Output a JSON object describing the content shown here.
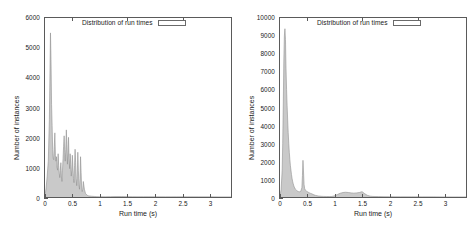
{
  "figure": {
    "panel_count": 2,
    "background": "#ffffff",
    "fill_color": "#c8c8c8",
    "line_color": "#8a8a8a",
    "axis_color": "#5a5a5a"
  },
  "panels": [
    {
      "name": "left-histogram",
      "legend_label": "Distribution of run times",
      "xlabel": "Run time (s)",
      "ylabel": "Number of instances",
      "xticks": [
        "0",
        "0.5",
        "1",
        "1.5",
        "2",
        "2.5",
        "3"
      ],
      "yticks": [
        "0",
        "1000",
        "2000",
        "3000",
        "4000",
        "5000",
        "6000"
      ]
    },
    {
      "name": "right-histogram",
      "legend_label": "Distribution of run times",
      "xlabel": "Run time (s)",
      "ylabel": "Number of instances",
      "xticks": [
        "0",
        "0.5",
        "1",
        "1.5",
        "2",
        "2.5",
        "3"
      ],
      "yticks": [
        "0",
        "1000",
        "2000",
        "3000",
        "4000",
        "5000",
        "6000",
        "7000",
        "8000",
        "9000",
        "10000"
      ]
    }
  ],
  "chart_data": [
    {
      "type": "area",
      "title": "Distribution of run times",
      "legend": [
        "Distribution of run times"
      ],
      "legend_position": "top-center-inside",
      "xlabel": "Run time (s)",
      "ylabel": "Number of instances",
      "xlim": [
        0,
        3.4
      ],
      "ylim": [
        0,
        6000
      ],
      "xticks": [
        0,
        0.5,
        1,
        1.5,
        2,
        2.5,
        3
      ],
      "yticks": [
        0,
        1000,
        2000,
        3000,
        4000,
        5000,
        6000
      ],
      "grid": false,
      "x": [
        0.0,
        0.02,
        0.04,
        0.06,
        0.08,
        0.1,
        0.11,
        0.12,
        0.13,
        0.14,
        0.15,
        0.16,
        0.17,
        0.18,
        0.19,
        0.2,
        0.21,
        0.22,
        0.23,
        0.24,
        0.25,
        0.26,
        0.27,
        0.28,
        0.29,
        0.3,
        0.31,
        0.32,
        0.33,
        0.34,
        0.35,
        0.36,
        0.37,
        0.38,
        0.39,
        0.4,
        0.41,
        0.42,
        0.43,
        0.44,
        0.45,
        0.46,
        0.47,
        0.48,
        0.49,
        0.5,
        0.51,
        0.52,
        0.53,
        0.54,
        0.55,
        0.56,
        0.57,
        0.58,
        0.59,
        0.6,
        0.61,
        0.62,
        0.63,
        0.64,
        0.65,
        0.66,
        0.67,
        0.68,
        0.69,
        0.7,
        0.72,
        0.74,
        0.76,
        0.78,
        0.8,
        0.85,
        0.9,
        0.95,
        1.0,
        1.1,
        1.2,
        1.3,
        1.4,
        1.5,
        1.6,
        1.7,
        1.8,
        1.9,
        2.0,
        2.1,
        2.2,
        2.3,
        2.4,
        2.6,
        2.8,
        3.0,
        3.2,
        3.4
      ],
      "values": [
        40,
        300,
        700,
        1200,
        2600,
        5500,
        4600,
        3100,
        2400,
        1600,
        1300,
        1250,
        1700,
        2150,
        1400,
        1200,
        1350,
        1000,
        900,
        1450,
        1050,
        800,
        650,
        900,
        1150,
        700,
        520,
        900,
        1300,
        1700,
        2050,
        1500,
        1200,
        1600,
        2250,
        1750,
        1100,
        1500,
        2000,
        1300,
        950,
        1450,
        1100,
        700,
        900,
        1400,
        1000,
        620,
        480,
        1050,
        1600,
        1150,
        620,
        380,
        700,
        1500,
        900,
        420,
        260,
        620,
        1350,
        820,
        300,
        180,
        260,
        520,
        260,
        120,
        80,
        50,
        35,
        25,
        18,
        12,
        10,
        8,
        12,
        15,
        14,
        12,
        10,
        8,
        9,
        10,
        8,
        7,
        6,
        6,
        7,
        6,
        5,
        5,
        4,
        4
      ]
    },
    {
      "type": "area",
      "title": "Distribution of run times",
      "legend": [
        "Distribution of run times"
      ],
      "legend_position": "top-center-inside",
      "xlabel": "Run time (s)",
      "ylabel": "Number of instances",
      "xlim": [
        0,
        3.4
      ],
      "ylim": [
        0,
        10000
      ],
      "xticks": [
        0,
        0.5,
        1,
        1.5,
        2,
        2.5,
        3
      ],
      "yticks": [
        0,
        1000,
        2000,
        3000,
        4000,
        5000,
        6000,
        7000,
        8000,
        9000,
        10000
      ],
      "grid": false,
      "x": [
        0.0,
        0.02,
        0.04,
        0.05,
        0.06,
        0.07,
        0.08,
        0.09,
        0.1,
        0.11,
        0.12,
        0.13,
        0.14,
        0.15,
        0.16,
        0.17,
        0.18,
        0.19,
        0.2,
        0.21,
        0.22,
        0.23,
        0.24,
        0.25,
        0.26,
        0.28,
        0.3,
        0.32,
        0.34,
        0.36,
        0.38,
        0.4,
        0.41,
        0.42,
        0.43,
        0.44,
        0.45,
        0.46,
        0.48,
        0.5,
        0.52,
        0.54,
        0.56,
        0.58,
        0.6,
        0.62,
        0.65,
        0.7,
        0.75,
        0.8,
        0.85,
        0.9,
        0.95,
        1.0,
        1.05,
        1.1,
        1.15,
        1.2,
        1.25,
        1.3,
        1.35,
        1.4,
        1.45,
        1.5,
        1.55,
        1.6,
        1.65,
        1.7,
        1.8,
        1.9,
        2.0,
        2.1,
        2.2,
        2.4,
        2.6,
        2.8,
        3.0,
        3.2,
        3.4
      ],
      "values": [
        60,
        400,
        1500,
        3000,
        5200,
        7600,
        9000,
        9400,
        8800,
        7200,
        6000,
        5100,
        4300,
        3600,
        3000,
        2500,
        2100,
        1750,
        1500,
        1250,
        1050,
        880,
        760,
        650,
        560,
        440,
        380,
        330,
        300,
        290,
        320,
        520,
        1200,
        2050,
        1400,
        700,
        480,
        400,
        340,
        300,
        260,
        230,
        200,
        180,
        150,
        120,
        90,
        55,
        40,
        32,
        28,
        26,
        30,
        70,
        140,
        210,
        250,
        265,
        250,
        230,
        215,
        230,
        250,
        300,
        180,
        90,
        45,
        30,
        22,
        18,
        16,
        14,
        12,
        10,
        8,
        7,
        6,
        5,
        4
      ]
    }
  ]
}
